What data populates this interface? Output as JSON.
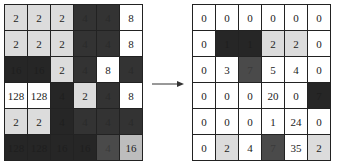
{
  "left_grid": {
    "rows": [
      [
        {
          "v": "2",
          "s": "lg"
        },
        {
          "v": "2",
          "s": "lg"
        },
        {
          "v": "2",
          "s": "lg"
        },
        {
          "v": "4",
          "s": "d"
        },
        {
          "v": "4",
          "s": "d"
        },
        {
          "v": "8",
          "s": "w"
        }
      ],
      [
        {
          "v": "2",
          "s": "lg"
        },
        {
          "v": "2",
          "s": "lg"
        },
        {
          "v": "2",
          "s": "lg"
        },
        {
          "v": "4",
          "s": "d"
        },
        {
          "v": "4",
          "s": "d"
        },
        {
          "v": "8",
          "s": "w"
        }
      ],
      [
        {
          "v": "16",
          "s": "k"
        },
        {
          "v": "16",
          "s": "k"
        },
        {
          "v": "2",
          "s": "lg"
        },
        {
          "v": "4",
          "s": "d"
        },
        {
          "v": "8",
          "s": "w"
        },
        {
          "v": "4",
          "s": "d"
        }
      ],
      [
        {
          "v": "128",
          "s": "w"
        },
        {
          "v": "128",
          "s": "w"
        },
        {
          "v": "4",
          "s": "k"
        },
        {
          "v": "2",
          "s": "lg"
        },
        {
          "v": "4",
          "s": "d"
        },
        {
          "v": "8",
          "s": "w"
        }
      ],
      [
        {
          "v": "2",
          "s": "lg"
        },
        {
          "v": "2",
          "s": "lg"
        },
        {
          "v": "4",
          "s": "k"
        },
        {
          "v": "4",
          "s": "d"
        },
        {
          "v": "4",
          "s": "d"
        },
        {
          "v": "4",
          "s": "d"
        }
      ],
      [
        {
          "v": "128",
          "s": "k"
        },
        {
          "v": "128",
          "s": "k"
        },
        {
          "v": "16",
          "s": "k"
        },
        {
          "v": "16",
          "s": "k"
        },
        {
          "v": "4",
          "s": "m"
        },
        {
          "v": "16",
          "s": "g"
        }
      ]
    ]
  },
  "arrow": {
    "direction": "right"
  },
  "right_grid": {
    "rows": [
      [
        {
          "v": "0",
          "s": "w"
        },
        {
          "v": "0",
          "s": "w"
        },
        {
          "v": "0",
          "s": "w"
        },
        {
          "v": "0",
          "s": "w"
        },
        {
          "v": "0",
          "s": "w"
        },
        {
          "v": "0",
          "s": "w"
        }
      ],
      [
        {
          "v": "0",
          "s": "w"
        },
        {
          "v": "1",
          "s": "k"
        },
        {
          "v": "1",
          "s": "k"
        },
        {
          "v": "2",
          "s": "lg"
        },
        {
          "v": "2",
          "s": "lg"
        },
        {
          "v": "0",
          "s": "w"
        }
      ],
      [
        {
          "v": "0",
          "s": "w"
        },
        {
          "v": "3",
          "s": "w"
        },
        {
          "v": "7",
          "s": "m"
        },
        {
          "v": "5",
          "s": "w"
        },
        {
          "v": "4",
          "s": "w"
        },
        {
          "v": "0",
          "s": "w"
        }
      ],
      [
        {
          "v": "0",
          "s": "w"
        },
        {
          "v": "0",
          "s": "w"
        },
        {
          "v": "0",
          "s": "w"
        },
        {
          "v": "20",
          "s": "w"
        },
        {
          "v": "0",
          "s": "w"
        },
        {
          "v": "7",
          "s": "k"
        }
      ],
      [
        {
          "v": "0",
          "s": "w"
        },
        {
          "v": "0",
          "s": "w"
        },
        {
          "v": "0",
          "s": "w"
        },
        {
          "v": "1",
          "s": "w"
        },
        {
          "v": "24",
          "s": "w"
        },
        {
          "v": "0",
          "s": "w"
        }
      ],
      [
        {
          "v": "0",
          "s": "w"
        },
        {
          "v": "2",
          "s": "lg"
        },
        {
          "v": "4",
          "s": "w"
        },
        {
          "v": "7",
          "s": "m"
        },
        {
          "v": "35",
          "s": "w"
        },
        {
          "v": "2",
          "s": "lg"
        }
      ]
    ]
  }
}
